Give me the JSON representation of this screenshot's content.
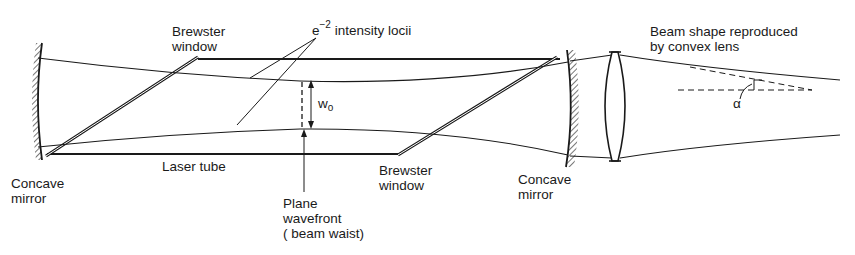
{
  "diagram": {
    "labels": {
      "brewster_window_top_line1": "Brewster",
      "brewster_window_top_line2": "window",
      "intensity_e": "e",
      "intensity_exp": "−2",
      "intensity_rest": "intensity locii",
      "beam_shape_line1": "Beam shape reproduced",
      "beam_shape_line2": "by convex lens",
      "waist_symbol_w": "w",
      "waist_symbol_sub": "o",
      "alpha": "α",
      "concave_mirror_left_line1": "Concave",
      "concave_mirror_left_line2": "mirror",
      "laser_tube": "Laser tube",
      "plane_wavefront_line1": "Plane",
      "plane_wavefront_line2": "wavefront",
      "plane_wavefront_line3": "( beam waist)",
      "brewster_window_bottom_line1": "Brewster",
      "brewster_window_bottom_line2": "window",
      "concave_mirror_right_line1": "Concave",
      "concave_mirror_right_line2": "mirror"
    },
    "colors": {
      "ink": "#1a1a1a",
      "background": "#ffffff"
    }
  }
}
